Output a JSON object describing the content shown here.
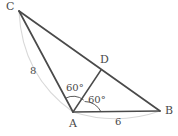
{
  "figure": {
    "type": "geometry-diagram",
    "background_color": "#ffffff",
    "stroke_color": "#4a4a4a",
    "arc_color": "#d8d8d8",
    "angle_arc_color": "#4a4a4a",
    "vertices": [
      {
        "name": "C",
        "label": "C",
        "x": 19,
        "y": 11
      },
      {
        "name": "D",
        "label": "D",
        "x": 101,
        "y": 70
      },
      {
        "name": "A",
        "label": "A",
        "x": 73,
        "y": 112
      },
      {
        "name": "B",
        "label": "B",
        "x": 160,
        "y": 111
      }
    ],
    "segments": [
      {
        "name": "segment-CB",
        "from": "C",
        "to": "B"
      },
      {
        "name": "segment-CA",
        "from": "C",
        "to": "A"
      },
      {
        "name": "segment-AD",
        "from": "A",
        "to": "D"
      },
      {
        "name": "segment-AB",
        "from": "A",
        "to": "B"
      }
    ],
    "side_measures": [
      {
        "name": "side-CA",
        "value": "8",
        "segment": "CA"
      },
      {
        "name": "side-AB",
        "value": "6",
        "segment": "AB"
      }
    ],
    "angles": [
      {
        "name": "angle-CAD",
        "value": "60°",
        "vertex": "A",
        "between": [
          "AC",
          "AD"
        ]
      },
      {
        "name": "angle-DAB",
        "value": "60°",
        "vertex": "A",
        "between": [
          "AD",
          "AB"
        ]
      }
    ],
    "guide_arcs": [
      {
        "name": "guide-arc-CA",
        "from": "C",
        "to": "A",
        "bulge": "outward-left"
      },
      {
        "name": "guide-arc-AB",
        "from": "A",
        "to": "B",
        "bulge": "downward"
      }
    ]
  }
}
